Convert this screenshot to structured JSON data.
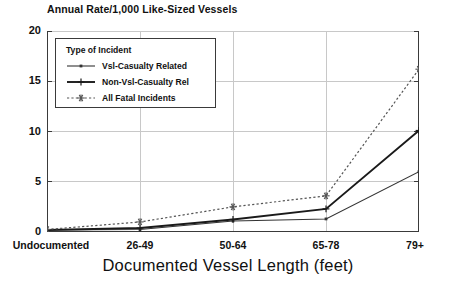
{
  "chart_data": {
    "type": "line",
    "title": "Annual Rate/1,000 Like-Sized Vessels",
    "xlabel": "Documented Vessel Length (feet)",
    "ylabel": "",
    "categories": [
      "Undocumented",
      "26-49",
      "50-64",
      "65-78",
      "79+"
    ],
    "ylim": [
      0,
      20
    ],
    "yticks": [
      "0",
      "5",
      "10",
      "15",
      "20"
    ],
    "ytick_values": [
      0,
      5,
      10,
      15,
      20
    ],
    "grid": true,
    "legend_position": "upper-left-inside",
    "legend_title": "Type of Incident",
    "series": [
      {
        "name": "Vsl-Casualty Related",
        "marker": "dot",
        "linestyle": "solid-thin",
        "color": "#333333",
        "values": [
          0.2,
          0.25,
          1.1,
          1.3,
          6.0
        ]
      },
      {
        "name": "Non-Vsl-Casualty Rel",
        "marker": "plus",
        "linestyle": "solid-thick",
        "color": "#1a1a1a",
        "values": [
          0.2,
          0.4,
          1.25,
          2.3,
          10.1
        ]
      },
      {
        "name": "All Fatal Incidents",
        "marker": "asterisk",
        "linestyle": "dotted",
        "color": "#555555",
        "values": [
          0.25,
          1.0,
          2.5,
          3.6,
          16.2
        ]
      }
    ]
  },
  "colors": {
    "axis": "#3a3a3a",
    "grid": "#c8c8c8",
    "background": "#ffffff",
    "text": "#111111"
  }
}
